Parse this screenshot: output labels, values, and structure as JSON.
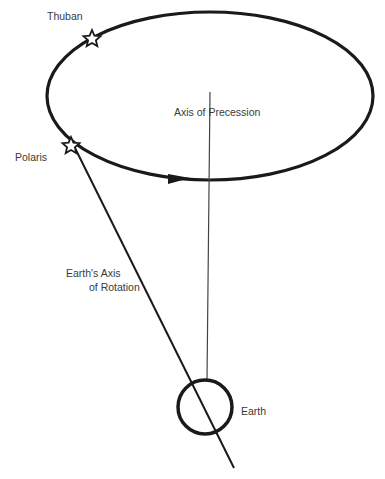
{
  "diagram": {
    "labels": {
      "thuban": "Thuban",
      "polaris": "Polaris",
      "axis_precession": "Axis of Precession",
      "earth_axis_line1": "Earth's Axis",
      "earth_axis_line2": "of Rotation",
      "earth": "Earth"
    },
    "colors": {
      "stroke": "#1a1a1a",
      "text": "#3a3a3a",
      "background": "#ffffff"
    },
    "icons": {
      "thuban_star": "star-outline",
      "polaris_star": "star-outline",
      "direction_arrow": "arrowhead-right"
    }
  }
}
